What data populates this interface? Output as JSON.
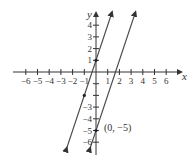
{
  "chart_data": {
    "type": "line",
    "title": "",
    "xlabel": "x",
    "ylabel": "y",
    "xlim": [
      -6,
      6
    ],
    "ylim": [
      -6,
      4
    ],
    "grid": false,
    "x_ticks": [
      "-6",
      "-5",
      "-4",
      "-3",
      "-2",
      "-1",
      "1",
      "2",
      "3",
      "4",
      "5",
      "6"
    ],
    "y_ticks_pos": [
      "1",
      "2",
      "3",
      "4"
    ],
    "y_ticks_neg": [
      "-3",
      "-4",
      "-5",
      "-6"
    ],
    "series": [
      {
        "name": "line-1",
        "equation": "y = 3x + 1",
        "slope": 3,
        "intercept": 1,
        "points": [
          [
            -1,
            -2
          ],
          [
            0,
            1
          ]
        ]
      },
      {
        "name": "line-2",
        "equation": "y = 3x - 5",
        "slope": 3,
        "intercept": -5,
        "points": [
          [
            0,
            -5
          ]
        ]
      }
    ],
    "annotations": [
      {
        "text": "(0, −5)",
        "x": 0,
        "y": -5
      }
    ],
    "colors": {
      "axis": "#333333",
      "line": "#444444"
    }
  },
  "labels": {
    "x_axis": "x",
    "y_axis": "y",
    "point_label": "(0, −5)"
  }
}
